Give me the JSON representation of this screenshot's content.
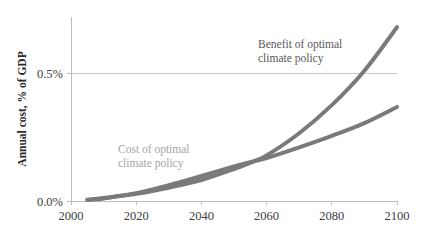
{
  "chart_data": {
    "type": "line",
    "title": "",
    "subtitle": "",
    "xlabel": "",
    "ylabel": "Annual cost, % of GDP",
    "xlim": [
      2000,
      2100
    ],
    "ylim": [
      0.0,
      0.72
    ],
    "xticks": [
      2000,
      2020,
      2040,
      2060,
      2080,
      2100
    ],
    "xtick_labels": [
      "2000",
      "2020",
      "2040",
      "2060",
      "2080",
      "2100"
    ],
    "yticks": [
      0.0,
      0.5
    ],
    "ytick_labels": [
      "0.0%",
      "0.5%"
    ],
    "grid": "horizontal-only",
    "legend_position": "inline-annotations",
    "x": [
      2005,
      2010,
      2020,
      2030,
      2040,
      2050,
      2056,
      2060,
      2070,
      2080,
      2090,
      2100
    ],
    "series": [
      {
        "name": "Benefit of optimal climate policy",
        "color": "#7a7a7a",
        "values": [
          0.005,
          0.012,
          0.028,
          0.052,
          0.082,
          0.125,
          0.155,
          0.178,
          0.265,
          0.375,
          0.51,
          0.68
        ]
      },
      {
        "name": "Cost of optimal climate policy",
        "color": "#7a7a7a",
        "values": [
          0.004,
          0.01,
          0.03,
          0.062,
          0.098,
          0.135,
          0.155,
          0.168,
          0.21,
          0.255,
          0.305,
          0.368
        ]
      }
    ],
    "annotations": [
      {
        "id": "benefit-label",
        "lines": [
          "Benefit of optimal",
          "climate policy"
        ],
        "color": "#595959",
        "x_px": 258,
        "y_px": 48
      },
      {
        "id": "cost-label",
        "lines": [
          "Cost of optimal",
          "climate policy"
        ],
        "color": "#a6a6a6",
        "x_px": 118,
        "y_px": 153
      }
    ],
    "axis_colors": {
      "axis_line": "#bfbfbf",
      "grid_line": "#c9c9c9",
      "tick_text": "#3d3d3d",
      "axis_title": "#2b2b2b"
    },
    "plot_geometry": {
      "left_px": 71,
      "right_px": 397,
      "bottom_px": 201,
      "top_px": 17,
      "series_stroke_width": 4
    }
  }
}
